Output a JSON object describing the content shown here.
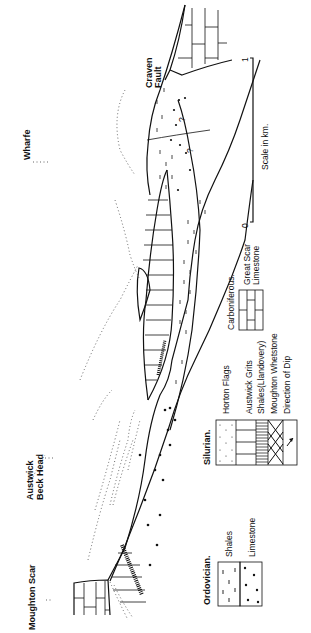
{
  "figure": {
    "orientation": "rotated-90-ccw",
    "type": "geological cross-section"
  },
  "places": {
    "moughton_scar": "Moughton Scar",
    "austwick_beck_head": "Austwick Beck Head",
    "wharfe": "Wharfe",
    "craven_fault": "Craven Fault",
    "question_mark": "?"
  },
  "legend": {
    "ordovician": {
      "title": "Ordovician.",
      "items": [
        {
          "pattern": "dashes",
          "label": "Shales"
        },
        {
          "pattern": "dots",
          "label": "Limestone"
        }
      ]
    },
    "silurian": {
      "title": "Silurian.",
      "items": [
        {
          "pattern": "fine-dots",
          "label": "Horton Flags"
        },
        {
          "pattern": "vertical-lines",
          "label": "Austwick Grits"
        },
        {
          "pattern": "dense-vertical-lines",
          "label": "Shales(Llandovery)"
        },
        {
          "pattern": "cross-hatch",
          "label": "Moughton Whetstone"
        },
        {
          "pattern": "arrow",
          "label": "Direction of Dip"
        }
      ]
    },
    "carboniferous": {
      "title": "Carboniferous.",
      "items": [
        {
          "pattern": "brick",
          "label_line1": "Great Scar",
          "label_line2": "Limestone"
        }
      ]
    }
  },
  "scale": {
    "start": "0",
    "end": "1",
    "label": "Scale in km."
  }
}
